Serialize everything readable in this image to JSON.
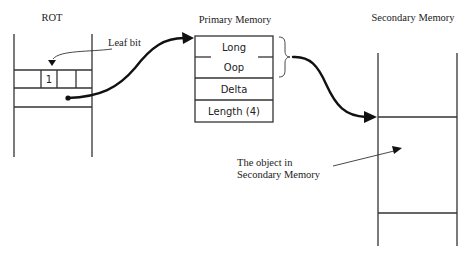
{
  "diagram": {
    "rot": {
      "title": "ROT",
      "cell_value": "1",
      "leaf_label": "Leaf bit"
    },
    "primary": {
      "title": "Primary Memory",
      "fields": [
        "Long",
        "Oop",
        "Delta",
        "Length (4)"
      ]
    },
    "secondary": {
      "title": "Secondary Memory",
      "annotation_line1": "The object in",
      "annotation_line2": "Secondary Memory"
    }
  }
}
